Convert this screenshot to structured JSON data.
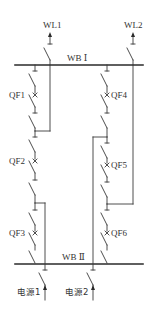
{
  "diagram": {
    "type": "electrical-single-line-diagram",
    "colors": {
      "line": "#3a3a3a",
      "bus": "#2a2a2a",
      "text": "#333333",
      "background": "#ffffff"
    },
    "buses": [
      {
        "id": "wb1",
        "label": "WB Ⅰ",
        "y": 65
      },
      {
        "id": "wb2",
        "label": "WB Ⅱ",
        "y": 264
      }
    ],
    "feeders": [
      {
        "id": "wl1",
        "label": "WL1"
      },
      {
        "id": "wl2",
        "label": "WL2"
      }
    ],
    "breakers": [
      {
        "id": "qf1",
        "label": "QF1"
      },
      {
        "id": "qf2",
        "label": "QF2"
      },
      {
        "id": "qf3",
        "label": "QF3"
      },
      {
        "id": "qf4",
        "label": "QF4"
      },
      {
        "id": "qf5",
        "label": "QF5"
      },
      {
        "id": "qf6",
        "label": "QF6"
      }
    ],
    "sources": [
      {
        "id": "src1",
        "label": "电源1"
      },
      {
        "id": "src2",
        "label": "电源2"
      }
    ]
  }
}
